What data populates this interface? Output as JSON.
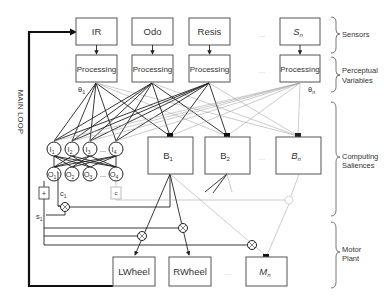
{
  "sensors": [
    {
      "label": "IR"
    },
    {
      "label": "Odo"
    },
    {
      "label": "Resis"
    },
    {
      "label": "S",
      "sub": "n"
    }
  ],
  "processing": [
    {
      "label": "Processing"
    },
    {
      "label": "Processing"
    },
    {
      "label": "Processing"
    },
    {
      "label": "Processing"
    }
  ],
  "theta_labels": {
    "first": "θ",
    "first_sub": "1",
    "last": "θ",
    "last_sub": "n"
  },
  "input_nodes": [
    {
      "label": "I",
      "sub": "1"
    },
    {
      "label": "I",
      "sub": "2"
    },
    {
      "label": "I",
      "sub": "3"
    },
    {
      "label": "I",
      "sub": "4"
    }
  ],
  "output_nodes": [
    {
      "label": "O",
      "sub": "1"
    },
    {
      "label": "O",
      "sub": "2"
    },
    {
      "label": "O",
      "sub": "3"
    },
    {
      "label": "O",
      "sub": "4"
    }
  ],
  "behaviors": [
    {
      "label": "B",
      "sub": "1"
    },
    {
      "label": "B",
      "sub": "2"
    },
    {
      "label": "B",
      "sub": "n"
    }
  ],
  "motors": [
    {
      "label": "LWheel"
    },
    {
      "label": "RWheel"
    },
    {
      "label": "M",
      "sub": "n"
    }
  ],
  "signals": {
    "c": "c",
    "c_sub": "1",
    "s": "s",
    "s_sub": "1",
    "sum": "+",
    "sum_faded": "c"
  },
  "ellipsis": "...",
  "main_loop": "MAIN LOOP",
  "layers": [
    {
      "label": "Sensors"
    },
    {
      "label": "Perceptual",
      "label2": "Variables"
    },
    {
      "label": "Computing",
      "label2": "Saliences"
    },
    {
      "label": "Motor",
      "label2": "Plant"
    }
  ]
}
